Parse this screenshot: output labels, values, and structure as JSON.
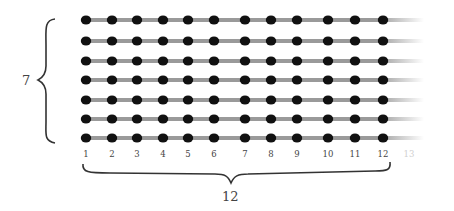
{
  "diagram": {
    "rows": 7,
    "columns": 12,
    "row_label": "7",
    "column_label": "12",
    "column_numbers": [
      "1",
      "2",
      "3",
      "4",
      "5",
      "6",
      "7",
      "8",
      "9",
      "10",
      "11",
      "12"
    ],
    "faded_column_number": "13",
    "row_y": [
      20,
      41,
      61,
      80,
      100,
      119,
      138
    ],
    "col_x": [
      86,
      112,
      137,
      163,
      188,
      214,
      245,
      271,
      297,
      328,
      355,
      383
    ],
    "colors": {
      "dot": "#111111",
      "line": "#9a9a9a",
      "text": "#444444",
      "faded_text": "#cfcfcf"
    }
  }
}
